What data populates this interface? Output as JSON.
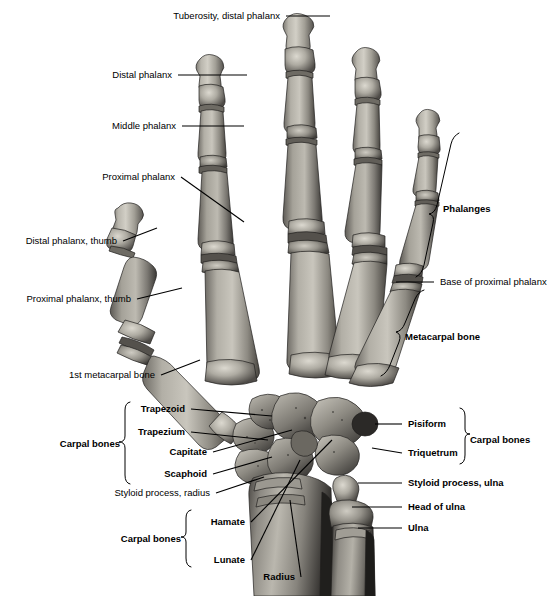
{
  "figure": {
    "view": "dorsal/posterior view of right hand skeleton",
    "background_color": "#ffffff",
    "line_color": "#000000",
    "bone_colors": {
      "highlight": "#d7d4cc",
      "midtone": "#9d9a92",
      "shadow": "#585552",
      "deep_shadow": "#2e2c2a",
      "outline": "#1a1a1a"
    }
  },
  "labels": {
    "left_upper": [
      {
        "id": "tuberosity-distal-phalanx",
        "text": "Tuberosity, distal phalanx",
        "weight": "regular",
        "align": "right",
        "x": 280,
        "y": 12,
        "leader": [
          [
            286,
            16
          ],
          [
            330,
            16
          ]
        ]
      },
      {
        "id": "distal-phalanx",
        "text": "Distal phalanx",
        "weight": "regular",
        "align": "right",
        "x": 172,
        "y": 71,
        "leader": [
          [
            178,
            75
          ],
          [
            247,
            75
          ]
        ]
      },
      {
        "id": "middle-phalanx",
        "text": "Middle phalanx",
        "weight": "regular",
        "align": "right",
        "x": 176,
        "y": 122,
        "leader": [
          [
            182,
            126
          ],
          [
            244,
            126
          ]
        ]
      },
      {
        "id": "proximal-phalanx",
        "text": "Proximal phalanx",
        "weight": "regular",
        "align": "right",
        "x": 175,
        "y": 173,
        "leader": [
          [
            181,
            177
          ],
          [
            244,
            222
          ]
        ]
      },
      {
        "id": "distal-phalanx-thumb",
        "text": "Distal phalanx, thumb",
        "weight": "regular",
        "align": "right",
        "x": 117,
        "y": 237,
        "leader": [
          [
            123,
            241
          ],
          [
            157,
            228
          ]
        ]
      },
      {
        "id": "proximal-phalanx-thumb",
        "text": "Proximal phalanx, thumb",
        "weight": "regular",
        "align": "right",
        "x": 131,
        "y": 295,
        "leader": [
          [
            137,
            299
          ],
          [
            182,
            288
          ]
        ]
      },
      {
        "id": "first-metacarpal-bone",
        "text": "1st metacarpal bone",
        "weight": "regular",
        "align": "right",
        "x": 155,
        "y": 371,
        "leader": [
          [
            161,
            375
          ],
          [
            200,
            360
          ]
        ]
      }
    ],
    "left_lower": [
      {
        "id": "trapezoid",
        "text": "Trapezoid",
        "weight": "bold",
        "align": "right",
        "x": 185,
        "y": 405,
        "leader": [
          [
            191,
            409
          ],
          [
            272,
            416
          ]
        ]
      },
      {
        "id": "trapezium",
        "text": "Trapezium",
        "weight": "bold",
        "align": "right",
        "x": 185,
        "y": 428,
        "leader": [
          [
            191,
            432
          ],
          [
            268,
            440
          ]
        ]
      },
      {
        "id": "capitate",
        "text": "Capitate",
        "weight": "bold",
        "align": "right",
        "x": 207,
        "y": 448,
        "leader": [
          [
            213,
            452
          ],
          [
            290,
            432
          ]
        ]
      },
      {
        "id": "scaphoid",
        "text": "Scaphoid",
        "weight": "bold",
        "align": "right",
        "x": 207,
        "y": 470,
        "leader": [
          [
            213,
            474
          ],
          [
            272,
            457
          ]
        ]
      },
      {
        "id": "styloid-process-radius",
        "text": "Styloid process, radius",
        "weight": "regular",
        "align": "right",
        "x": 210,
        "y": 489,
        "leader": [
          [
            216,
            493
          ],
          [
            262,
            478
          ]
        ]
      },
      {
        "id": "hamate",
        "text": "Hamate",
        "weight": "bold",
        "align": "right",
        "x": 245,
        "y": 518,
        "leader": [
          [
            251,
            522
          ],
          [
            300,
            497
          ]
        ]
      },
      {
        "id": "lunate",
        "text": "Lunate",
        "weight": "bold",
        "align": "right",
        "x": 245,
        "y": 556,
        "leader": [
          [
            251,
            560
          ],
          [
            297,
            505
          ]
        ]
      },
      {
        "id": "radius",
        "text": "Radius",
        "weight": "bold",
        "align": "right",
        "x": 295,
        "y": 573,
        "leader": [
          [
            301,
            577
          ],
          [
            326,
            510
          ]
        ]
      }
    ],
    "left_group_braces": [
      {
        "id": "carpal-bones-upper",
        "text": "Carpal bones",
        "weight": "bold",
        "align": "right",
        "x": 120,
        "y": 440,
        "brace": {
          "x": 126,
          "y_top": 402,
          "y_bottom": 487,
          "dir": "right"
        }
      },
      {
        "id": "carpal-bones-lower",
        "text": "Carpal bones",
        "weight": "bold",
        "align": "right",
        "x": 181,
        "y": 535,
        "brace": {
          "x": 187,
          "y_top": 510,
          "y_bottom": 569,
          "dir": "right"
        }
      }
    ],
    "right_upper": [
      {
        "id": "base-of-proximal-phalanx",
        "text": "Base of proximal phalanx",
        "weight": "regular",
        "align": "left",
        "x": 440,
        "y": 278,
        "leader": [
          [
            434,
            282
          ],
          [
            398,
            282
          ]
        ]
      },
      {
        "id": "pisiform",
        "text": "Pisiform",
        "weight": "bold",
        "align": "left",
        "x": 408,
        "y": 420,
        "leader": [
          [
            402,
            424
          ],
          [
            372,
            424
          ]
        ]
      },
      {
        "id": "triquetrum",
        "text": "Triquetrum",
        "weight": "bold",
        "align": "left",
        "x": 408,
        "y": 449,
        "leader": [
          [
            402,
            453
          ],
          [
            372,
            448
          ]
        ]
      },
      {
        "id": "styloid-process-ulna",
        "text": "Styloid process, ulna",
        "weight": "bold",
        "align": "left",
        "x": 408,
        "y": 479,
        "leader": [
          [
            402,
            483
          ],
          [
            360,
            483
          ]
        ]
      },
      {
        "id": "head-of-ulna",
        "text": "Head of ulna",
        "weight": "bold",
        "align": "left",
        "x": 408,
        "y": 503,
        "leader": [
          [
            402,
            507
          ],
          [
            355,
            507
          ]
        ]
      },
      {
        "id": "ulna",
        "text": "Ulna",
        "weight": "bold",
        "align": "left",
        "x": 408,
        "y": 524,
        "leader": [
          [
            402,
            528
          ],
          [
            360,
            528
          ]
        ]
      }
    ],
    "right_group_braces": [
      {
        "id": "phalanges",
        "text": "Phalanges",
        "weight": "bold",
        "align": "left",
        "x": 443,
        "y": 205,
        "brace": {
          "dir": "left-slanted",
          "top": [
            457,
            133
          ],
          "bottom": [
            424,
            282
          ]
        }
      },
      {
        "id": "metacarpal-bone",
        "text": "Metacarpal bone",
        "weight": "bold",
        "align": "left",
        "x": 405,
        "y": 333,
        "brace": {
          "dir": "left-slanted",
          "top": [
            423,
            290
          ],
          "bottom": [
            383,
            375
          ]
        }
      },
      {
        "id": "carpal-bones-right",
        "text": "Carpal bones",
        "weight": "bold",
        "align": "left",
        "x": 470,
        "y": 436,
        "brace": {
          "x": 464,
          "y_top": 408,
          "y_bottom": 466,
          "dir": "left"
        }
      }
    ]
  },
  "anatomy": {
    "regions": [
      "distal phalanges",
      "middle phalanges",
      "proximal phalanges",
      "metacarpal bones",
      "carpal bones",
      "radius",
      "ulna"
    ],
    "carpal_bones_named": [
      "Trapezoid",
      "Trapezium",
      "Capitate",
      "Scaphoid",
      "Hamate",
      "Lunate",
      "Pisiform",
      "Triquetrum"
    ]
  }
}
